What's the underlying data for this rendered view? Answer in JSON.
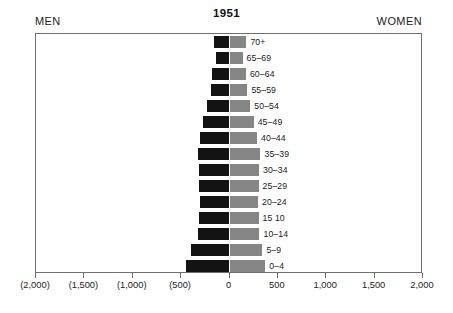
{
  "header": {
    "men_label": "MEN",
    "women_label": "WOMEN",
    "title": "1951"
  },
  "chart_data": {
    "type": "bar",
    "subtype": "population-pyramid",
    "title": "1951",
    "xlabel": "",
    "ylabel": "",
    "grid": false,
    "legend_position": "top-outside",
    "orientation": "horizontal",
    "xlim": [
      -2000,
      2000
    ],
    "x_tick_values": [
      -2000,
      -1500,
      -1000,
      -500,
      0,
      500,
      1000,
      1500,
      2000
    ],
    "x_tick_labels": [
      "(2,000)",
      "(1,500)",
      "(1,000)",
      "(500)",
      "0",
      "500",
      "1,000",
      "1,500",
      "2,000"
    ],
    "categories": [
      "70+",
      "65–69",
      "60–64",
      "55–59",
      "50–54",
      "45–49",
      "40–44",
      "35–39",
      "30–34",
      "25–29",
      "20–24",
      "15  10",
      "10–14",
      "5–9",
      "0–4"
    ],
    "series": [
      {
        "name": "MEN",
        "color": "#131313",
        "side": "left",
        "values": [
          165,
          140,
          180,
          195,
          230,
          270,
          300,
          330,
          320,
          315,
          310,
          320,
          325,
          395,
          445
        ]
      },
      {
        "name": "WOMEN",
        "color": "#858585",
        "side": "right",
        "values": [
          175,
          135,
          170,
          185,
          215,
          250,
          285,
          320,
          305,
          300,
          295,
          300,
          310,
          340,
          370
        ]
      }
    ]
  }
}
